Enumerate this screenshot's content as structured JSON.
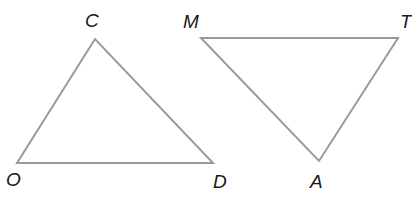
{
  "figure": {
    "line_color": "#9a9a9a",
    "label_color": "#1a1a1a"
  },
  "triangles": [
    {
      "name": "COD",
      "vertices": [
        {
          "label": "C",
          "x": 95,
          "y": 39,
          "label_x": 85,
          "label_y": 11
        },
        {
          "label": "O",
          "x": 17,
          "y": 163,
          "label_x": 6,
          "label_y": 170
        },
        {
          "label": "D",
          "x": 213,
          "y": 163,
          "label_x": 213,
          "label_y": 172
        }
      ]
    },
    {
      "name": "MTA",
      "vertices": [
        {
          "label": "M",
          "x": 201,
          "y": 38,
          "label_x": 183,
          "label_y": 12
        },
        {
          "label": "T",
          "x": 398,
          "y": 38,
          "label_x": 400,
          "label_y": 12
        },
        {
          "label": "A",
          "x": 319,
          "y": 161,
          "label_x": 310,
          "label_y": 172
        }
      ]
    }
  ]
}
